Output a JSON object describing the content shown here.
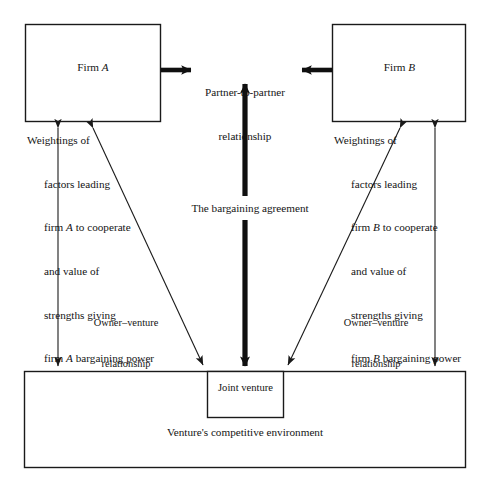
{
  "diagram": {
    "colors": {
      "stroke": "#1a1a1a",
      "text": "#141414",
      "background": "#ffffff",
      "emphasis_stroke": "#101010"
    },
    "firm_a": {
      "title": "Firm A",
      "title_plain": "Firm",
      "title_italic": "A",
      "lines": [
        "Weightings of",
        "factors leading",
        "firm A to cooperate",
        "and value of",
        "strengths giving",
        "firm A bargaining power"
      ]
    },
    "firm_b": {
      "title": "Firm B",
      "title_plain": "Firm",
      "title_italic": "B",
      "lines": [
        "Weightings of",
        "factors leading",
        "firm B to cooperate",
        "and value of",
        "strengths giving",
        "firm B bargaining power"
      ]
    },
    "partner_relationship": {
      "line1": "Partner-to-partner",
      "line2": "relationship"
    },
    "bargaining_agreement": {
      "label": "The bargaining agreement"
    },
    "owner_venture_left": {
      "line1": "Owner–venture",
      "line2": "relationship"
    },
    "owner_venture_right": {
      "line1": "Owner–venture",
      "line2": "relationship"
    },
    "joint_venture": {
      "label": "Joint venture"
    },
    "environment": {
      "label": "Venture's competitive environment"
    }
  }
}
